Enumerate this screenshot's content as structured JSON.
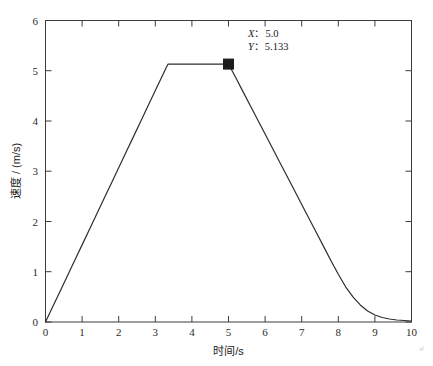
{
  "chart_data": {
    "type": "line",
    "title": "",
    "xlabel": "时间/s",
    "ylabel": "速度 / (m/s)",
    "xlim": [
      0,
      10
    ],
    "ylim": [
      0,
      6
    ],
    "xticks": [
      "0",
      "1",
      "2",
      "3",
      "4",
      "5",
      "6",
      "7",
      "8",
      "9",
      "10"
    ],
    "yticks": [
      "0",
      "1",
      "2",
      "3",
      "4",
      "5",
      "6"
    ],
    "grid": false,
    "legend": null,
    "series": [
      {
        "name": "速度",
        "color": "#2e2e2e",
        "x": [
          0.0,
          0.2,
          0.4,
          0.6,
          0.8,
          1.0,
          1.2,
          1.4,
          1.6,
          1.8,
          2.0,
          2.2,
          2.4,
          2.6,
          2.8,
          3.0,
          3.2,
          3.3,
          3.35,
          3.45,
          3.6,
          4.0,
          4.4,
          4.8,
          5.0,
          5.2,
          5.4,
          5.6,
          5.8,
          6.0,
          6.4,
          6.8,
          7.0,
          7.2,
          7.4,
          7.6,
          7.8,
          8.0,
          8.2,
          8.4,
          8.6,
          8.8,
          9.0,
          9.2,
          9.4,
          9.6,
          9.8,
          10.0
        ],
        "y": [
          0.0,
          0.307,
          0.614,
          0.921,
          1.228,
          1.535,
          1.842,
          2.149,
          2.456,
          2.763,
          3.07,
          3.377,
          3.684,
          3.991,
          4.298,
          4.605,
          4.912,
          5.066,
          5.133,
          5.133,
          5.133,
          5.133,
          5.133,
          5.133,
          5.133,
          4.86,
          4.58,
          4.3,
          4.02,
          3.74,
          3.18,
          2.62,
          2.34,
          2.06,
          1.78,
          1.5,
          1.22,
          0.95,
          0.7,
          0.5,
          0.34,
          0.22,
          0.14,
          0.09,
          0.06,
          0.04,
          0.03,
          0.02
        ]
      }
    ],
    "annotations": [
      {
        "name": "data-cursor",
        "x": 5.0,
        "y": 5.133,
        "marker": "filled-square",
        "marker_color": "#1c1c1c",
        "label_x_var": "X",
        "label_x_sep": "：",
        "label_x_value": "5.0",
        "label_y_var": "Y",
        "label_y_sep": "：",
        "label_y_value": "5.133"
      }
    ]
  },
  "axes": {
    "x_label": "时间/s",
    "y_label": "速度 / (m/s)",
    "x_ticks": [
      "0",
      "1",
      "2",
      "3",
      "4",
      "5",
      "6",
      "7",
      "8",
      "9",
      "10"
    ],
    "y_ticks": [
      "0",
      "1",
      "2",
      "3",
      "4",
      "5",
      "6"
    ]
  },
  "cursor": {
    "x_var": "X",
    "y_var": "Y",
    "sep": "：",
    "x_value": "5.0",
    "y_value": "5.133"
  },
  "colors": {
    "curve": "#2e2e2e",
    "frame": "#3c3c3c",
    "marker": "#1c1c1c",
    "background": "#ffffff",
    "text": "#1a1a1a"
  }
}
